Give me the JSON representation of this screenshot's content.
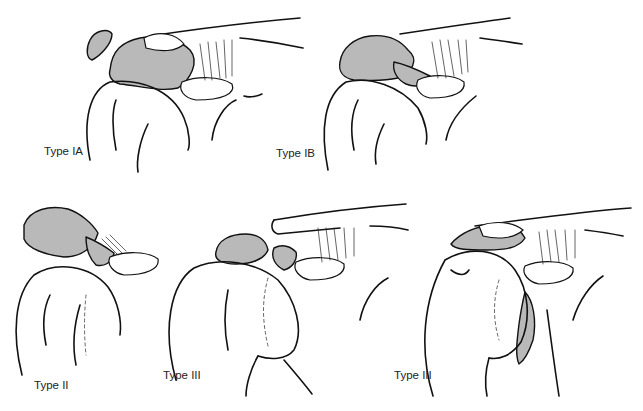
{
  "figure": {
    "panels": [
      {
        "id": "type-ia",
        "label": "Type IA"
      },
      {
        "id": "type-ib",
        "label": "Type IB"
      },
      {
        "id": "type-ii",
        "label": "Type II"
      },
      {
        "id": "type-iii-a",
        "label": "Type III"
      },
      {
        "id": "type-iii-b",
        "label": "Type III"
      }
    ],
    "colors": {
      "bone_fill": "#b9b9b9",
      "ink": "#111111",
      "background": "#ffffff"
    }
  }
}
